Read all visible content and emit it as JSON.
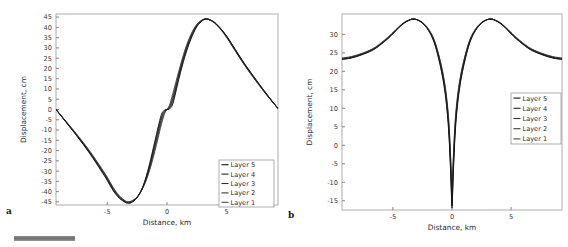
{
  "figure": {
    "panels": [
      {
        "letter": "a",
        "xlabel": "Distance, km",
        "ylabel": "Displacement, cm",
        "xticks": [
          -5,
          0,
          5
        ],
        "yticks": [
          45,
          40,
          35,
          30,
          25,
          20,
          15,
          10,
          5,
          0,
          -5,
          -10,
          -15,
          -20,
          -25,
          -30,
          -35,
          -40,
          -45
        ],
        "legend": [
          "Layer 5",
          "Layer 4",
          "Layer 3",
          "Layer 2",
          "Layer 1"
        ]
      },
      {
        "letter": "b",
        "xlabel": "Distance, km",
        "ylabel": "Displacement, cm",
        "xticks": [
          -5,
          0,
          5
        ],
        "yticks": [
          30,
          25,
          20,
          15,
          10,
          5,
          0,
          -5,
          -10,
          -15
        ],
        "legend": [
          "Layer 5",
          "Layer 4",
          "Layer 3",
          "Layer 2",
          "Layer 1"
        ]
      }
    ]
  },
  "chart_data": [
    {
      "type": "line",
      "title": "",
      "xlabel": "Distance, km",
      "ylabel": "Displacement, cm",
      "xlim": [
        -9.3,
        9.3
      ],
      "ylim": [
        -46.5,
        46.5
      ],
      "xticks": [
        -5,
        0,
        5
      ],
      "yticks": [
        45,
        40,
        35,
        30,
        25,
        20,
        15,
        10,
        5,
        0,
        -5,
        -10,
        -15,
        -20,
        -25,
        -30,
        -35,
        -40,
        -45
      ],
      "grid": false,
      "legend_position": "lower-right",
      "legend": [
        "Layer 5",
        "Layer 4",
        "Layer 3",
        "Layer 2",
        "Layer 1"
      ],
      "x": [
        -9.3,
        -8.5,
        -7.5,
        -6.5,
        -5.5,
        -5.0,
        -4.5,
        -4.0,
        -3.5,
        -3.3,
        -3.0,
        -2.5,
        -2.0,
        -1.5,
        -1.0,
        -0.5,
        -0.2,
        0.0,
        0.2,
        0.5,
        1.0,
        1.5,
        2.0,
        2.5,
        3.0,
        3.3,
        3.5,
        4.0,
        4.5,
        5.0,
        5.5,
        6.5,
        7.5,
        8.5,
        9.3
      ],
      "series": [
        {
          "name": "Layer 5",
          "values": [
            0.0,
            -5.5,
            -12.5,
            -20.0,
            -28.5,
            -33.0,
            -38.0,
            -42.0,
            -44.4,
            -44.8,
            -44.6,
            -42.5,
            -38.0,
            -30.5,
            -20.0,
            -8.0,
            -2.0,
            0.0,
            2.0,
            8.0,
            19.0,
            29.0,
            36.5,
            41.5,
            43.8,
            44.0,
            43.8,
            42.0,
            39.0,
            35.0,
            30.5,
            21.5,
            13.5,
            6.0,
            0.5
          ]
        },
        {
          "name": "Layer 4",
          "values": [
            0.0,
            -5.6,
            -12.7,
            -20.3,
            -28.8,
            -33.4,
            -38.4,
            -42.3,
            -44.6,
            -45.0,
            -44.8,
            -42.6,
            -37.8,
            -29.8,
            -18.8,
            -6.8,
            -1.5,
            0.0,
            1.5,
            6.8,
            18.0,
            28.2,
            36.0,
            41.2,
            43.7,
            44.0,
            43.8,
            42.1,
            39.1,
            35.2,
            30.7,
            21.7,
            13.6,
            6.1,
            0.5
          ]
        },
        {
          "name": "Layer 3",
          "values": [
            0.0,
            -5.7,
            -12.9,
            -20.6,
            -29.2,
            -33.8,
            -38.8,
            -42.6,
            -44.8,
            -45.2,
            -45.0,
            -42.7,
            -37.6,
            -29.0,
            -17.5,
            -5.5,
            -1.0,
            0.0,
            1.0,
            5.5,
            17.0,
            27.4,
            35.4,
            40.9,
            43.6,
            44.0,
            43.8,
            42.2,
            39.2,
            35.4,
            30.9,
            21.9,
            13.8,
            6.2,
            0.5
          ]
        },
        {
          "name": "Layer 2",
          "values": [
            0.0,
            -5.8,
            -13.1,
            -20.9,
            -29.6,
            -34.2,
            -39.2,
            -42.9,
            -45.0,
            -45.4,
            -45.2,
            -42.8,
            -37.4,
            -28.2,
            -16.2,
            -4.2,
            -0.6,
            0.0,
            0.6,
            4.2,
            16.0,
            26.6,
            34.8,
            40.6,
            43.5,
            44.0,
            43.9,
            42.3,
            39.3,
            35.6,
            31.1,
            22.1,
            14.0,
            6.3,
            0.5
          ]
        },
        {
          "name": "Layer 1",
          "values": [
            0.0,
            -5.9,
            -13.3,
            -21.2,
            -30.0,
            -34.6,
            -39.6,
            -43.2,
            -45.2,
            -45.6,
            -45.4,
            -42.9,
            -37.2,
            -27.4,
            -15.0,
            -3.0,
            -0.3,
            0.0,
            0.3,
            3.0,
            15.0,
            25.8,
            34.2,
            40.3,
            43.4,
            44.0,
            43.9,
            42.4,
            39.4,
            35.8,
            31.3,
            22.3,
            14.2,
            6.4,
            0.5
          ]
        }
      ]
    },
    {
      "type": "line",
      "title": "",
      "xlabel": "Distance, km",
      "ylabel": "Displacement, cm",
      "xlim": [
        -9.3,
        9.3
      ],
      "ylim": [
        -17.5,
        35.5
      ],
      "xticks": [
        -5,
        0,
        5
      ],
      "yticks": [
        30,
        25,
        20,
        15,
        10,
        5,
        0,
        -5,
        -10,
        -15
      ],
      "grid": false,
      "legend_position": "center-right",
      "legend": [
        "Layer 5",
        "Layer 4",
        "Layer 3",
        "Layer 2",
        "Layer 1"
      ],
      "x": [
        -9.3,
        -8.5,
        -7.5,
        -6.5,
        -5.5,
        -5.0,
        -4.5,
        -4.0,
        -3.5,
        -3.3,
        -3.0,
        -2.5,
        -2.0,
        -1.5,
        -1.0,
        -0.6,
        -0.3,
        -0.1,
        0.0,
        0.1,
        0.3,
        0.6,
        1.0,
        1.5,
        2.0,
        2.5,
        3.0,
        3.3,
        3.5,
        4.0,
        4.5,
        5.0,
        5.5,
        6.5,
        7.5,
        8.5,
        9.3
      ],
      "series": [
        {
          "name": "Layer 5",
          "values": [
            23.6,
            24.0,
            25.0,
            26.5,
            29.0,
            30.5,
            32.0,
            33.3,
            34.0,
            34.1,
            34.0,
            33.2,
            31.5,
            28.5,
            23.0,
            16.5,
            8.0,
            -4.0,
            -14.0,
            -4.0,
            8.0,
            16.5,
            23.0,
            28.5,
            31.5,
            33.2,
            34.0,
            34.1,
            34.0,
            33.3,
            32.0,
            30.5,
            29.0,
            26.5,
            25.0,
            24.0,
            23.6
          ]
        },
        {
          "name": "Layer 4",
          "values": [
            23.5,
            23.9,
            24.9,
            26.4,
            28.9,
            30.4,
            32.0,
            33.3,
            34.0,
            34.1,
            34.0,
            33.2,
            31.4,
            28.3,
            22.7,
            16.0,
            7.2,
            -5.2,
            -15.0,
            -5.2,
            7.2,
            16.0,
            22.7,
            28.3,
            31.4,
            33.2,
            34.0,
            34.1,
            34.0,
            33.3,
            32.0,
            30.4,
            28.9,
            26.4,
            24.9,
            23.9,
            23.5
          ]
        },
        {
          "name": "Layer 3",
          "values": [
            23.4,
            23.8,
            24.8,
            26.3,
            28.8,
            30.3,
            31.9,
            33.2,
            34.0,
            34.1,
            34.0,
            33.1,
            31.3,
            28.1,
            22.4,
            15.5,
            6.4,
            -6.4,
            -15.8,
            -6.4,
            6.4,
            15.5,
            22.4,
            28.1,
            31.3,
            33.1,
            34.0,
            34.1,
            34.0,
            33.2,
            31.9,
            30.3,
            28.8,
            26.3,
            24.8,
            23.8,
            23.4
          ]
        },
        {
          "name": "Layer 2",
          "values": [
            23.3,
            23.7,
            24.7,
            26.2,
            28.7,
            30.2,
            31.9,
            33.2,
            34.0,
            34.1,
            34.0,
            33.1,
            31.2,
            27.9,
            22.0,
            15.0,
            5.6,
            -7.4,
            -16.4,
            -7.4,
            5.6,
            15.0,
            22.0,
            27.9,
            31.2,
            33.1,
            34.0,
            34.1,
            34.0,
            33.2,
            31.9,
            30.2,
            28.7,
            26.2,
            24.7,
            23.7,
            23.3
          ]
        },
        {
          "name": "Layer 1",
          "values": [
            23.2,
            23.6,
            24.6,
            26.1,
            28.6,
            30.1,
            31.8,
            33.1,
            34.0,
            34.1,
            34.0,
            33.0,
            31.1,
            27.7,
            21.6,
            14.5,
            4.8,
            -8.4,
            -17.0,
            -8.4,
            4.8,
            14.5,
            21.6,
            27.7,
            31.1,
            33.0,
            34.0,
            34.1,
            34.0,
            33.1,
            31.8,
            30.1,
            28.6,
            26.1,
            24.6,
            23.6,
            23.2
          ]
        }
      ]
    }
  ]
}
